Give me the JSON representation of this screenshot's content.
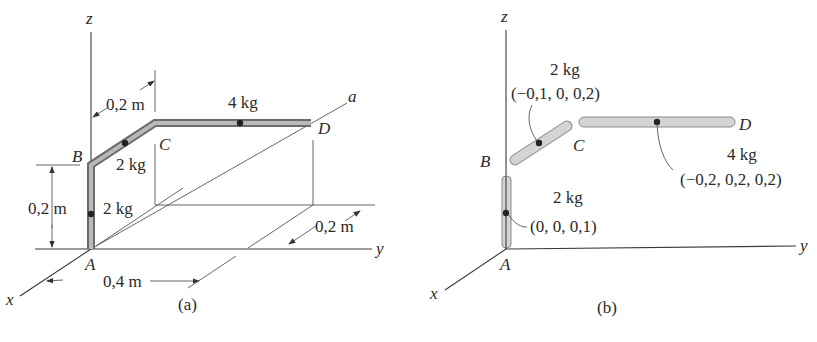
{
  "figure_a": {
    "caption": "(a)",
    "axes": {
      "x": "x",
      "y": "y",
      "z": "z",
      "a": "a"
    },
    "points": {
      "A": "A",
      "B": "B",
      "C": "C",
      "D": "D"
    },
    "dimensions": {
      "bc_length": "0,2 m",
      "ab_height": "0,2 m",
      "ad_offset": "0,4 m",
      "d_offset": "0,2 m"
    },
    "masses": {
      "ab": "2 kg",
      "bc": "2 kg",
      "cd": "4 kg"
    }
  },
  "figure_b": {
    "caption": "(b)",
    "axes": {
      "x": "x",
      "y": "y",
      "z": "z"
    },
    "points": {
      "A": "A",
      "B": "B",
      "C": "C",
      "D": "D"
    },
    "segments": [
      {
        "name": "AB",
        "mass": "2 kg",
        "centroid": "(0, 0, 0,1)"
      },
      {
        "name": "BC",
        "mass": "2 kg",
        "centroid": "(−0,1, 0, 0,2)"
      },
      {
        "name": "CD",
        "mass": "4 kg",
        "centroid": "(−0,2, 0,2, 0,2)"
      }
    ]
  }
}
